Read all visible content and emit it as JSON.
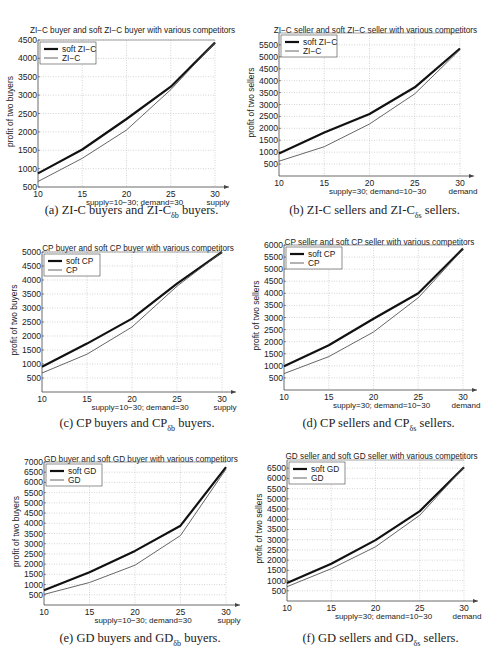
{
  "chart_data": [
    {
      "id": "a",
      "type": "line",
      "title": "ZI−C buyer and soft ZI−C buyer with various competitors",
      "xlabel": "supply=10−30; demand=30",
      "x_axis_end_label": "supply",
      "ylabel": "profit of two buyers",
      "x": [
        10,
        15,
        20,
        25,
        30
      ],
      "xticks": [
        10,
        15,
        20,
        25,
        30
      ],
      "yticks": [
        500,
        1000,
        1500,
        2000,
        2500,
        3000,
        3500,
        4000,
        4500
      ],
      "ylim": [
        500,
        4500
      ],
      "grid": true,
      "legend_position": "upper left",
      "series": [
        {
          "name": "soft ZI−C",
          "style": "thick",
          "values": [
            870,
            1520,
            2350,
            3230,
            4430
          ]
        },
        {
          "name": "ZI−C",
          "style": "thin",
          "values": [
            650,
            1280,
            2050,
            3150,
            4430
          ]
        }
      ],
      "caption": {
        "prefix": "(a) ZI-C buyers and ZI-C",
        "sub": "δb",
        "suffix": " buyers."
      }
    },
    {
      "id": "b",
      "type": "line",
      "title": "ZI−C seller and soft ZI−C seller with various competitors",
      "xlabel": "supply=30; demand=10−30",
      "x_axis_end_label": "demand",
      "ylabel": "profit of two sellers",
      "x": [
        10,
        15,
        20,
        25,
        30
      ],
      "xticks": [
        10,
        15,
        20,
        25,
        30
      ],
      "yticks": [
        500,
        1000,
        1500,
        2000,
        2500,
        3000,
        3500,
        4000,
        4500,
        5000,
        5500
      ],
      "ylim": [
        0,
        6000
      ],
      "grid": true,
      "legend_position": "upper left",
      "series": [
        {
          "name": "soft ZI−C",
          "style": "thick",
          "values": [
            950,
            1820,
            2600,
            3720,
            5350
          ]
        },
        {
          "name": "ZI−C",
          "style": "thin",
          "values": [
            620,
            1230,
            2180,
            3450,
            5300
          ]
        }
      ],
      "caption": {
        "prefix": "(b) ZI-C sellers and ZI-C",
        "sub": "δs",
        "suffix": " sellers."
      }
    },
    {
      "id": "c",
      "type": "line",
      "title": "CP buyer and soft CP buyer with various competitors",
      "xlabel": "supply=10−30; demand=30",
      "x_axis_end_label": "supply",
      "ylabel": "profit of two buyers",
      "x": [
        10,
        15,
        20,
        25,
        30
      ],
      "xticks": [
        10,
        15,
        20,
        25,
        30
      ],
      "yticks": [
        500,
        1000,
        1500,
        2000,
        2500,
        3000,
        3500,
        4000,
        4500,
        5000
      ],
      "ylim": [
        0,
        5000
      ],
      "grid": true,
      "legend_position": "upper left",
      "series": [
        {
          "name": "soft CP",
          "style": "thick",
          "values": [
            900,
            1730,
            2620,
            3870,
            5000
          ]
        },
        {
          "name": "CP",
          "style": "thin",
          "values": [
            680,
            1350,
            2320,
            3780,
            5000
          ]
        }
      ],
      "caption": {
        "prefix": "(c) CP buyers and CP",
        "sub": "δb",
        "suffix": " buyers."
      }
    },
    {
      "id": "d",
      "type": "line",
      "title": "CP seller and soft CP seller with various competitors",
      "xlabel": "supply=30; demand=10−30",
      "x_axis_end_label": "demand",
      "ylabel": "profit of two sellers",
      "x": [
        10,
        15,
        20,
        25,
        30
      ],
      "xticks": [
        10,
        15,
        20,
        25,
        30
      ],
      "yticks": [
        500,
        1000,
        1500,
        2000,
        2500,
        3000,
        3500,
        4000,
        4500,
        5000,
        5500,
        6000
      ],
      "ylim": [
        0,
        6000
      ],
      "grid": true,
      "legend_position": "upper left",
      "series": [
        {
          "name": "soft CP",
          "style": "thick",
          "values": [
            980,
            1850,
            2950,
            4000,
            5850
          ]
        },
        {
          "name": "CP",
          "style": "thin",
          "values": [
            680,
            1380,
            2400,
            3820,
            5820
          ]
        }
      ],
      "caption": {
        "prefix": "(d) CP sellers and CP",
        "sub": "δs",
        "suffix": " sellers."
      }
    },
    {
      "id": "e",
      "type": "line",
      "title": "GD buyer and soft GD buyer with various competitors",
      "xlabel": "supply=10−30; demand=30",
      "x_axis_end_label": "supply",
      "ylabel": "profit of two buyers",
      "x": [
        10,
        15,
        20,
        25,
        30
      ],
      "xticks": [
        10,
        15,
        20,
        25,
        30
      ],
      "yticks": [
        500,
        1000,
        1500,
        2000,
        2500,
        3000,
        3500,
        4000,
        4500,
        5000,
        5500,
        6000,
        6500,
        7000
      ],
      "ylim": [
        0,
        7000
      ],
      "grid": true,
      "legend_position": "upper left",
      "series": [
        {
          "name": "soft GD",
          "style": "thick",
          "values": [
            720,
            1600,
            2650,
            3880,
            6750
          ]
        },
        {
          "name": "GD",
          "style": "thin",
          "values": [
            520,
            1100,
            1950,
            3400,
            6650
          ]
        }
      ],
      "caption": {
        "prefix": "(e) GD buyers and GD",
        "sub": "δb",
        "suffix": " buyers."
      }
    },
    {
      "id": "f",
      "type": "line",
      "title": "GD seller and soft GD seller with various competitors",
      "xlabel": "supply=30; demand=10−30",
      "x_axis_end_label": "demand",
      "ylabel": "profit of two sellers",
      "x": [
        10,
        15,
        20,
        25,
        30
      ],
      "xticks": [
        10,
        15,
        20,
        25,
        30
      ],
      "yticks": [
        500,
        1000,
        1500,
        2000,
        2500,
        3000,
        3500,
        4000,
        4500,
        5000,
        5500,
        6000,
        6500
      ],
      "ylim": [
        0,
        6900
      ],
      "grid": true,
      "legend_position": "upper left",
      "series": [
        {
          "name": "soft GD",
          "style": "thick",
          "values": [
            880,
            1820,
            2980,
            4400,
            6550
          ]
        },
        {
          "name": "GD",
          "style": "thin",
          "values": [
            700,
            1580,
            2650,
            4200,
            6550
          ]
        }
      ],
      "caption": {
        "prefix": "(f) GD sellers and GD",
        "sub": "δs",
        "suffix": " sellers."
      }
    }
  ]
}
